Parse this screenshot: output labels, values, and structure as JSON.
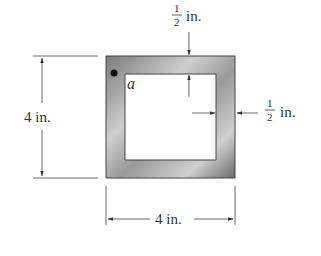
{
  "figure": {
    "type": "square thin-walled tube cross-section",
    "outer_width_label": "4 in.",
    "outer_height_label": "4 in.",
    "wall_thickness_top": {
      "numerator": "1",
      "denominator": "2",
      "unit": "in."
    },
    "wall_thickness_right": {
      "numerator": "1",
      "denominator": "2",
      "unit": "in."
    },
    "point_label": "a",
    "colors": {
      "wall_dark": "#6e6e6e",
      "wall_light": "#d8d8d8",
      "line": "#333333"
    }
  }
}
